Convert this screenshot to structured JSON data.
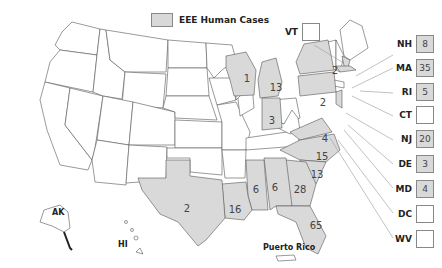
{
  "legend": {
    "label": "EEE Human Cases",
    "fill_color": "#d9d9d9"
  },
  "map_states": [
    {
      "code": "WI",
      "value": "1"
    },
    {
      "code": "MI",
      "value": "13"
    },
    {
      "code": "IN",
      "value": "3"
    },
    {
      "code": "NY",
      "value": "2"
    },
    {
      "code": "PA",
      "value": "2"
    },
    {
      "code": "VA",
      "value": "4"
    },
    {
      "code": "NC",
      "value": "15"
    },
    {
      "code": "SC",
      "value": "13"
    },
    {
      "code": "GA",
      "value": "28"
    },
    {
      "code": "AL",
      "value": "6"
    },
    {
      "code": "MS",
      "value": "6"
    },
    {
      "code": "LA",
      "value": "16"
    },
    {
      "code": "TX",
      "value": "2"
    },
    {
      "code": "FL",
      "value": "65"
    }
  ],
  "callouts": [
    {
      "code": "VT",
      "value": ""
    },
    {
      "code": "NH",
      "value": "8"
    },
    {
      "code": "MA",
      "value": "35"
    },
    {
      "code": "RI",
      "value": "5"
    },
    {
      "code": "CT",
      "value": ""
    },
    {
      "code": "NJ",
      "value": "20"
    },
    {
      "code": "DE",
      "value": "3"
    },
    {
      "code": "MD",
      "value": "4"
    },
    {
      "code": "DC",
      "value": ""
    },
    {
      "code": "WV",
      "value": ""
    }
  ],
  "territories": {
    "ak": "AK",
    "hi": "HI",
    "pr": "Puerto Rico"
  }
}
